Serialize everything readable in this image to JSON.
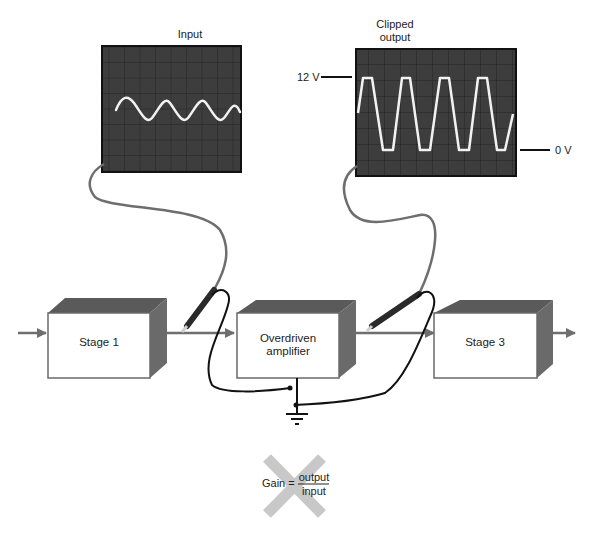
{
  "scopes": {
    "input": {
      "label": "Input",
      "trace": "sine"
    },
    "output": {
      "label_line1": "Clipped",
      "label_line2": "output",
      "trace": "clipped",
      "top_marker": "12 V",
      "bottom_marker": "0 V"
    }
  },
  "stages": [
    {
      "label": "Stage 1"
    },
    {
      "label_line1": "Overdriven",
      "label_line2": "amplifier"
    },
    {
      "label": "Stage 3"
    }
  ],
  "formula": {
    "lhs": "Gain =",
    "numerator": "output",
    "denominator": "input",
    "crossed_out": true
  },
  "colors": {
    "scope_bg": "#3d3d3d",
    "scope_grid": "#222222",
    "trace": "#f2f2f2",
    "box_top": "#5a5a5a",
    "box_side": "#6a6a6a",
    "signal_line": "#7a7a7a",
    "cross": "#c8c8c8"
  },
  "caption": ""
}
